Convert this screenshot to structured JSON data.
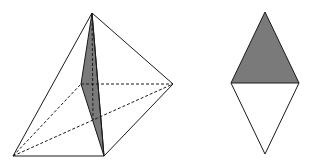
{
  "diagram": {
    "title": "",
    "colors": {
      "stroke": "#1a1a1a",
      "shade": "#7a7a7a",
      "background": "#ffffff"
    },
    "pyramid": {
      "vertices": {
        "apex": [
          92,
          13
        ],
        "right": [
          173,
          84
        ],
        "back": [
          81,
          84
        ],
        "base_left": [
          13,
          156
        ],
        "base_right": [
          104,
          156
        ],
        "foot": [
          93,
          120
        ]
      },
      "solid_edges": [
        [
          "apex",
          "base_left"
        ],
        [
          "apex",
          "right"
        ],
        [
          "apex",
          "base_right"
        ],
        [
          "base_left",
          "base_right"
        ],
        [
          "base_right",
          "right"
        ]
      ],
      "dashed_edges": [
        [
          "back",
          "right"
        ],
        [
          "base_left",
          "back"
        ],
        [
          "base_left",
          "right"
        ],
        [
          "apex",
          "foot"
        ]
      ],
      "shaded_section": [
        "apex",
        "back",
        "base_right"
      ]
    },
    "rhombus": {
      "vertices": {
        "top": [
          265,
          12
        ],
        "left": [
          231,
          83
        ],
        "right": [
          299,
          83
        ],
        "bottom": [
          265,
          154
        ]
      },
      "shaded_half": "top",
      "midline": [
        "left",
        "right"
      ]
    }
  }
}
